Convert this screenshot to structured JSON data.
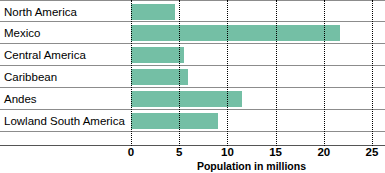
{
  "chart_data": {
    "type": "bar",
    "orientation": "horizontal",
    "title": "",
    "xlabel": "Population  in millions",
    "ylabel": "",
    "xlim": [
      0,
      25
    ],
    "xticks": [
      0,
      5,
      10,
      15,
      20,
      25
    ],
    "xtick_labels": [
      "0",
      "5",
      "10",
      "15",
      "20",
      "25"
    ],
    "grid": "vertical-dotted",
    "legend": "none",
    "bar_color": "#74bfa5",
    "categories": [
      "North America",
      "Mexico",
      "Central America",
      "Caribbean",
      "Andes",
      "Lowland South America"
    ],
    "values": [
      4.6,
      21.7,
      5.5,
      5.9,
      11.5,
      9.0
    ]
  },
  "colors": {
    "bar_fill": "#74bfa5",
    "row_rule": "#8c8c8c",
    "gridline": "#000000",
    "axis_line": "#555555",
    "text": "#000000",
    "background": "#ffffff"
  }
}
